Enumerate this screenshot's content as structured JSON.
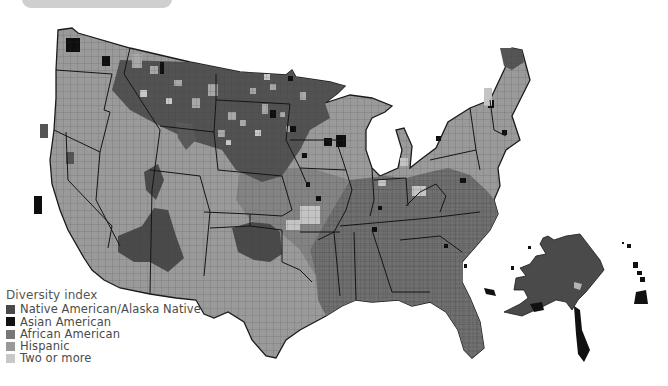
{
  "header": {
    "title": ""
  },
  "legend": {
    "title": "Diversity index",
    "items": [
      {
        "label": "Native American/Alaska Native",
        "color": "#4a4a4a"
      },
      {
        "label": "Asian American",
        "color": "#111111"
      },
      {
        "label": "African American",
        "color": "#777777"
      },
      {
        "label": "Hispanic",
        "color": "#999999"
      },
      {
        "label": "Two or more",
        "color": "#c8c8c8"
      }
    ]
  },
  "map": {
    "title": "US counties by diversity index",
    "regions": [
      "Contiguous United States",
      "Alaska",
      "Hawaii"
    ],
    "colors": {
      "native": "#4a4a4a",
      "asian": "#111111",
      "african": "#6e6e6e",
      "hispanic": "#9a9a9a",
      "two_or_more": "#c8c8c8",
      "border": "#222222"
    }
  }
}
